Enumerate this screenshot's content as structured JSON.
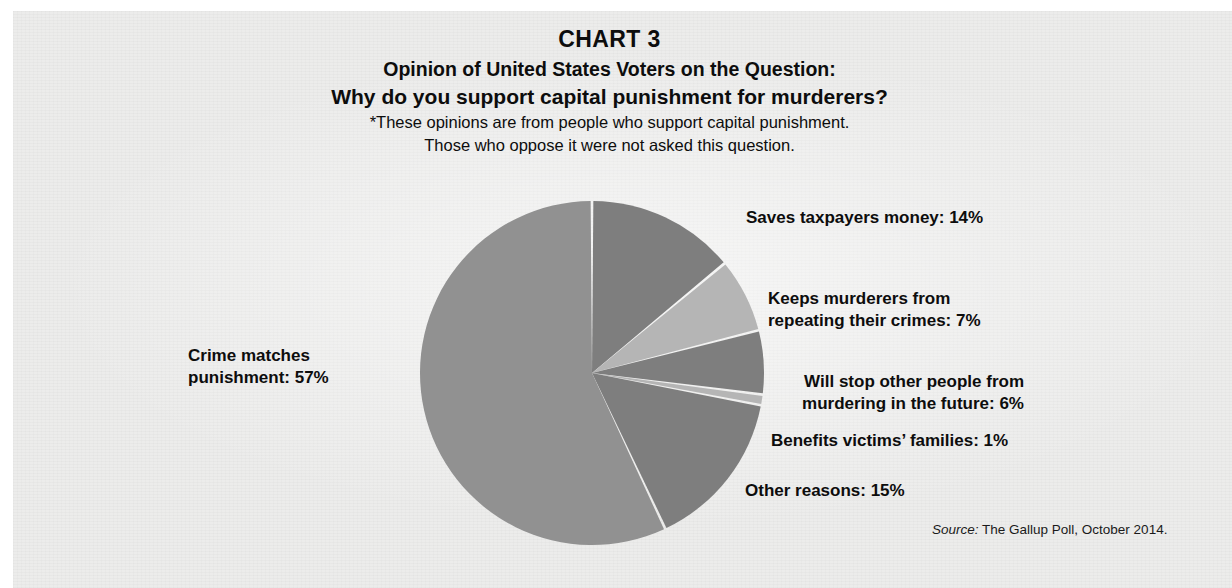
{
  "header": {
    "chart_label": "CHART 3",
    "subtitle_line1": "Opinion of United States Voters on the Question:",
    "subtitle_line2": "Why do you support capital punishment for murderers?",
    "footnote_line1": "*These opinions are from people who support capital punishment.",
    "footnote_line2": "Those who oppose it were not asked this question."
  },
  "labels": {
    "saves": "Saves taxpayers money: 14%",
    "keeps": "Keeps murderers from\nrepeating their crimes: 7%",
    "willstop": "Will stop other people from\nmurdering in the future: 6%",
    "benefits": "Benefits victims’ families: 1%",
    "other": "Other reasons: 15%",
    "crime": "Crime matches\npunishment: 57%"
  },
  "source": {
    "word": "Source:",
    "text": " The Gallup Poll, October 2014."
  },
  "colors": {
    "paper": "#ececeb",
    "slice_large": "#919191",
    "slice_dark": "#7e7e7e",
    "slice_light": "#b5b5b5",
    "text": "#0d0d0d"
  },
  "chart_data": {
    "type": "pie",
    "subtitle": "*These opinions are from people who support capital punishment. Those who oppose it were not asked this question.",
    "source": "The Gallup Poll, October 2014.",
    "unit": "percent",
    "total": 100,
    "start_angle_deg": 0,
    "direction": "clockwise",
    "legend": "callout labels placed around the pie",
    "categories": [
      "Saves taxpayers money",
      "Keeps murderers from repeating their crimes",
      "Will stop other people from murdering in the future",
      "Benefits victims' families",
      "Other reasons",
      "Crime matches punishment"
    ],
    "values": [
      14,
      7,
      6,
      1,
      15,
      57
    ],
    "slice_colors": [
      "#7e7e7e",
      "#b5b5b5",
      "#7e7e7e",
      "#b5b5b5",
      "#7e7e7e",
      "#919191"
    ],
    "slices": [
      {
        "label": "Saves taxpayers money: 14%",
        "value": 14
      },
      {
        "label": "Keeps murderers from repeating their crimes: 7%",
        "value": 7
      },
      {
        "label": "Will stop other people from murdering in the future: 6%",
        "value": 6
      },
      {
        "label": "Benefits victims’ families: 1%",
        "value": 1
      },
      {
        "label": "Other reasons: 15%",
        "value": 15
      },
      {
        "label": "Crime matches punishment: 57%",
        "value": 57
      }
    ]
  }
}
